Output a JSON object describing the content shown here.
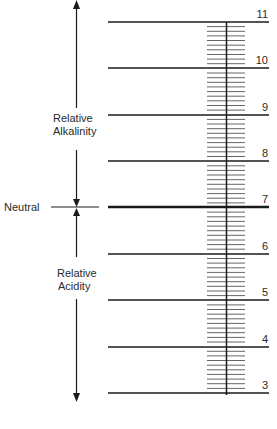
{
  "diagram": {
    "scale": {
      "min": 3,
      "max": 11,
      "major_ticks": [
        11,
        10,
        9,
        8,
        7,
        6,
        5,
        4,
        3
      ],
      "minor_divisions_per_unit": 10,
      "neutral_value": 7
    },
    "labels": {
      "alkalinity_line1": "Relative",
      "alkalinity_line2": "Alkalinity",
      "acidity_line1": "Relative",
      "acidity_line2": "Acidity",
      "neutral": "Neutral"
    },
    "tick_labels": {
      "t11": "11",
      "t10": "10",
      "t9": "9",
      "t8": "8",
      "t7": "7",
      "t6": "6",
      "t5": "5",
      "t4": "4",
      "t3": "3"
    },
    "colors": {
      "line": "#1a1a1a",
      "hatch": "#555555",
      "background": "#ffffff"
    }
  }
}
